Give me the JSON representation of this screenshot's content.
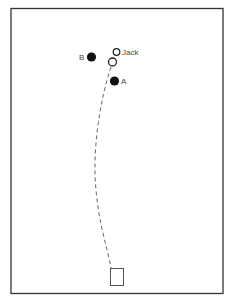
{
  "diagram": {
    "labels": {
      "jack": "Jack",
      "a": "A",
      "b": "B"
    },
    "colors": {
      "stroke": "#333333",
      "fill_solid": "#111111",
      "background": "#ffffff"
    }
  }
}
